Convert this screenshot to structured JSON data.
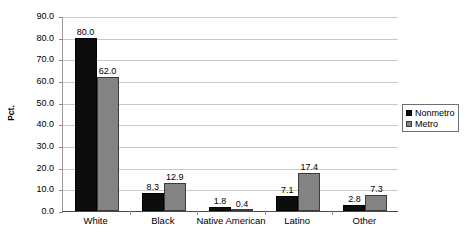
{
  "chart_data": {
    "type": "bar",
    "title": "",
    "subtitle": "",
    "xlabel": "",
    "ylabel": "Pct.",
    "ylim": [
      0,
      90
    ],
    "ytick_step": 10,
    "grid": true,
    "legend_position": "right",
    "categories": [
      "White",
      "Black",
      "Native American",
      "Latino",
      "Other"
    ],
    "ytick_labels": [
      "90.0",
      "80.0",
      "70.0",
      "60.0",
      "50.0",
      "40.0",
      "30.0",
      "20.0",
      "10.0",
      "0.0"
    ],
    "series": [
      {
        "name": "Nonmetro",
        "color": "#0D0D0D",
        "values": [
          80.0,
          8.3,
          1.8,
          7.1,
          2.8
        ],
        "labels": [
          "80.0",
          "8.3",
          "1.8",
          "7.1",
          "2.8"
        ]
      },
      {
        "name": "Metro",
        "color": "#838383",
        "values": [
          62.0,
          12.9,
          0.4,
          17.4,
          7.3
        ],
        "labels": [
          "62.0",
          "12.9",
          "0.4",
          "17.4",
          "7.3"
        ]
      }
    ]
  },
  "legend": {
    "items": [
      {
        "label": "Nonmetro",
        "swatch": "nonmetro"
      },
      {
        "label": "Metro",
        "swatch": "metro"
      }
    ]
  }
}
